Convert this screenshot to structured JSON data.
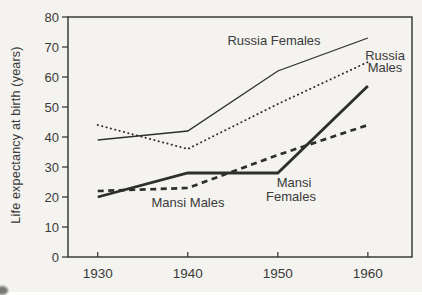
{
  "chart_data": {
    "type": "line",
    "title": "",
    "xlabel": "",
    "ylabel": "Life expectancy at birth (years)",
    "x": [
      1930,
      1940,
      1950,
      1960
    ],
    "x_tick_labels": [
      "1930",
      "1940",
      "1950",
      "1960"
    ],
    "y_ticks": [
      0,
      10,
      20,
      30,
      40,
      50,
      60,
      70,
      80
    ],
    "xlim": [
      1926.7,
      1964.9
    ],
    "ylim": [
      0,
      80
    ],
    "grid": false,
    "legend_position": "inline-annotations",
    "series": [
      {
        "name": "Russia Females",
        "style": "thin-solid",
        "values": [
          39,
          42,
          62,
          73
        ]
      },
      {
        "name": "Russia Males",
        "style": "dotted",
        "values": [
          44,
          36,
          51,
          65
        ]
      },
      {
        "name": "Mansi Females",
        "style": "thick-solid",
        "values": [
          20,
          28,
          28,
          57
        ]
      },
      {
        "name": "Mansi Males",
        "style": "thick-dashed",
        "values": [
          22,
          23,
          34,
          44
        ]
      }
    ],
    "annotations": [
      {
        "text": "Russia Females",
        "x": 274,
        "y": 45,
        "anchor": "middle"
      },
      {
        "text": "Russia",
        "x": 385,
        "y": 60,
        "anchor": "middle"
      },
      {
        "text": "Males",
        "x": 385,
        "y": 72,
        "anchor": "middle"
      },
      {
        "text": "Mansi Males",
        "x": 188,
        "y": 207,
        "anchor": "middle"
      },
      {
        "text": "Mansi",
        "x": 294,
        "y": 187,
        "anchor": "middle"
      },
      {
        "text": "Females",
        "x": 291,
        "y": 201,
        "anchor": "middle"
      }
    ],
    "colors": {
      "line_ink": "#2e2e2e",
      "text_ink": "#3a3a3a",
      "background": "#f4f3ef"
    }
  }
}
